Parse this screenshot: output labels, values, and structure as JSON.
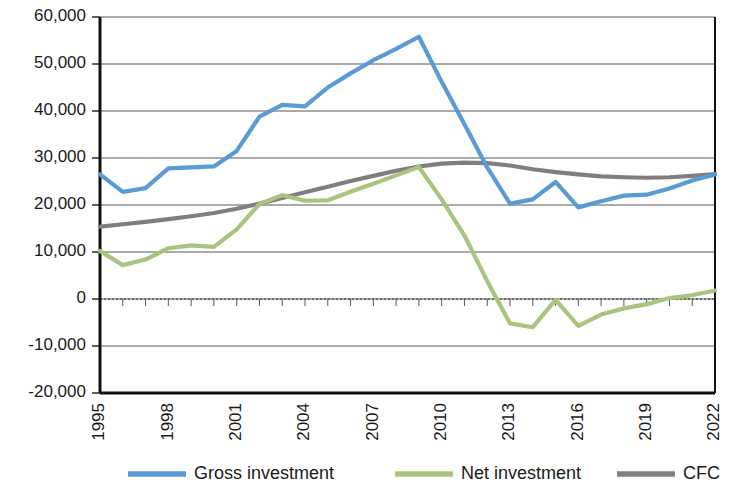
{
  "chart_data": {
    "type": "line",
    "title": "",
    "subtitle": "",
    "xlabel": "",
    "ylabel": "",
    "grid": true,
    "legend_position": "bottom",
    "xlim": [
      1995,
      2022
    ],
    "ylim": [
      -20000,
      60000
    ],
    "y_ticks": [
      60000,
      50000,
      40000,
      30000,
      20000,
      10000,
      0,
      -10000,
      -20000
    ],
    "y_tick_labels": [
      "60,000",
      "50,000",
      "40,000",
      "30,000",
      "20,000",
      "10,000",
      "0",
      "-10,000",
      "-20,000"
    ],
    "x": [
      1995,
      1996,
      1997,
      1998,
      1999,
      2000,
      2001,
      2002,
      2003,
      2004,
      2005,
      2006,
      2007,
      2008,
      2009,
      2010,
      2011,
      2012,
      2013,
      2014,
      2015,
      2016,
      2017,
      2018,
      2019,
      2020,
      2021,
      2022
    ],
    "x_tick_values": [
      1995,
      1998,
      2001,
      2004,
      2007,
      2010,
      2013,
      2016,
      2019,
      2022
    ],
    "x_tick_labels": [
      "1995",
      "1998",
      "2001",
      "2004",
      "2007",
      "2010",
      "2013",
      "2016",
      "2019",
      "2022"
    ],
    "series": [
      {
        "name": "Gross investment",
        "color": "#5B9BD5",
        "values": [
          26500,
          22800,
          23600,
          27800,
          28000,
          28200,
          31500,
          38800,
          41300,
          41000,
          45000,
          48000,
          50800,
          53200,
          55800,
          46200,
          37200,
          28000,
          20300,
          21200,
          24900,
          19500,
          20800,
          22000,
          22200,
          23500,
          25200,
          26500
        ]
      },
      {
        "name": "Net investment",
        "color": "#A9C47F",
        "values": [
          10200,
          7200,
          8400,
          10800,
          11400,
          11100,
          14800,
          20200,
          22100,
          20900,
          21000,
          22800,
          24500,
          26300,
          28100,
          21200,
          13500,
          3800,
          -5200,
          -6000,
          -200,
          -5700,
          -3300,
          -2000,
          -1100,
          200,
          800,
          1800
        ]
      },
      {
        "name": "CFC",
        "color": "#7F7F7F",
        "values": [
          15400,
          15900,
          16400,
          17000,
          17600,
          18300,
          19200,
          20300,
          21500,
          22700,
          23900,
          25100,
          26200,
          27300,
          28200,
          28800,
          29000,
          28900,
          28400,
          27600,
          27000,
          26500,
          26100,
          25900,
          25800,
          25900,
          26200,
          26600
        ]
      }
    ]
  },
  "legend": {
    "items": [
      {
        "label": "Gross investment",
        "color": "#5B9BD5"
      },
      {
        "label": "Net investment",
        "color": "#A9C47F"
      },
      {
        "label": "CFC",
        "color": "#7F7F7F"
      }
    ]
  },
  "colors": {
    "gross_investment": "#5B9BD5",
    "net_investment": "#A9C47F",
    "cfc": "#7F7F7F",
    "axis": "#1a1a1a",
    "gridline": "#595959",
    "background": "#ffffff"
  }
}
